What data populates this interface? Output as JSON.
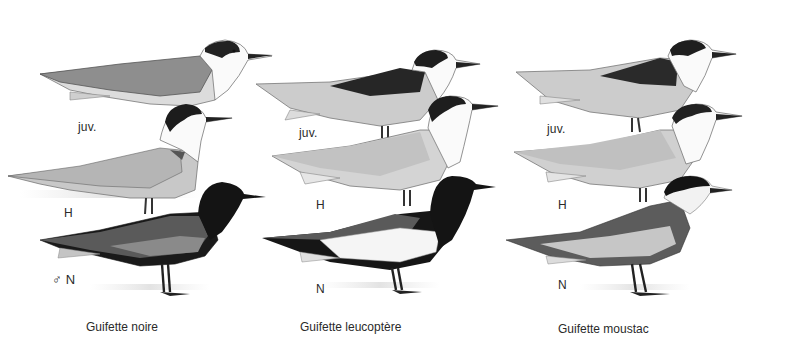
{
  "plate": {
    "columns": [
      {
        "species": "Guifette noire",
        "labels": {
          "juvenile": "juv.",
          "winter": "H",
          "breeding": "♂ N"
        }
      },
      {
        "species": "Guifette leucoptère",
        "labels": {
          "juvenile": "juv.",
          "winter": "H",
          "breeding": "N"
        }
      },
      {
        "species": "Guifette moustac",
        "labels": {
          "juvenile": "juv.",
          "winter": "H",
          "breeding": "N"
        }
      }
    ]
  },
  "colors": {
    "background": "#ffffff",
    "black_plumage": "#161616",
    "dark_grey": "#4a4a4a",
    "mid_grey": "#8c8c8c",
    "light_grey": "#c4c4c4",
    "pale_grey": "#dcdcdc",
    "white_plumage": "#fbfbfb"
  }
}
